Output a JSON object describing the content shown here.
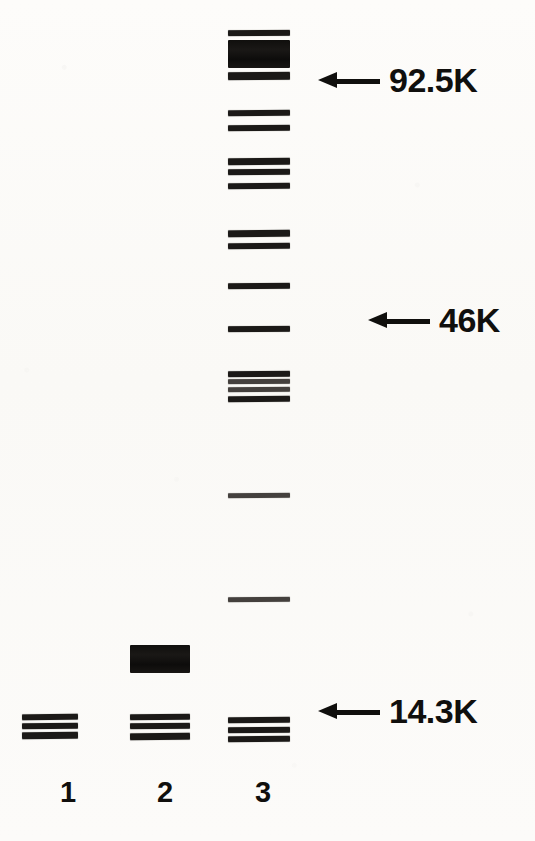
{
  "figure": {
    "type": "sds-page-gel-electrophoresis",
    "background_color": "#fbfaf7",
    "band_color": "#141210",
    "width": 535,
    "height": 841
  },
  "molecular_weight_markers": [
    {
      "label": "92.5K",
      "arrow": "left-arrow",
      "x": 318,
      "y": 63
    },
    {
      "label": "46K",
      "arrow": "left-arrow",
      "x": 368,
      "y": 303
    },
    {
      "label": "14.3K",
      "arrow": "left-arrow",
      "x": 318,
      "y": 694
    }
  ],
  "lane_labels": [
    {
      "label": "1",
      "x": 48,
      "y": 778
    },
    {
      "label": "2",
      "x": 145,
      "y": 778
    },
    {
      "label": "3",
      "x": 243,
      "y": 778
    }
  ],
  "lanes": [
    {
      "number": "1",
      "x": 22,
      "width": 56,
      "bands": [
        {
          "y": 714,
          "height": 6,
          "intensity": "strong",
          "skew": -0.7
        },
        {
          "y": 723,
          "height": 6,
          "intensity": "strong",
          "skew": -0.5
        },
        {
          "y": 732,
          "height": 7,
          "intensity": "strong",
          "skew": -0.6
        }
      ]
    },
    {
      "number": "2",
      "x": 130,
      "width": 60,
      "bands": [
        {
          "y": 645,
          "height": 28,
          "intensity": "very-strong",
          "skew": 0.0
        },
        {
          "y": 714,
          "height": 6,
          "intensity": "strong",
          "skew": -0.5
        },
        {
          "y": 723,
          "height": 6,
          "intensity": "strong",
          "skew": -0.4
        },
        {
          "y": 733,
          "height": 7,
          "intensity": "strong",
          "skew": -0.6
        }
      ]
    },
    {
      "number": "3",
      "x": 228,
      "width": 62,
      "bands": [
        {
          "y": 30,
          "height": 6,
          "intensity": "strong",
          "skew": -0.3
        },
        {
          "y": 40,
          "height": 28,
          "intensity": "very-strong",
          "skew": 0.0
        },
        {
          "y": 72,
          "height": 8,
          "intensity": "strong",
          "skew": -0.4
        },
        {
          "y": 110,
          "height": 6,
          "intensity": "strong",
          "skew": -0.5
        },
        {
          "y": 125,
          "height": 6,
          "intensity": "strong",
          "skew": -0.4
        },
        {
          "y": 158,
          "height": 7,
          "intensity": "strong",
          "skew": -0.5
        },
        {
          "y": 169,
          "height": 6,
          "intensity": "strong",
          "skew": -0.4
        },
        {
          "y": 183,
          "height": 6,
          "intensity": "strong",
          "skew": -0.5
        },
        {
          "y": 230,
          "height": 7,
          "intensity": "strong",
          "skew": -0.6
        },
        {
          "y": 243,
          "height": 6,
          "intensity": "strong",
          "skew": -0.5
        },
        {
          "y": 283,
          "height": 6,
          "intensity": "strong",
          "skew": -0.4
        },
        {
          "y": 326,
          "height": 6,
          "intensity": "strong",
          "skew": -0.3
        },
        {
          "y": 371,
          "height": 6,
          "intensity": "strong",
          "skew": -0.4
        },
        {
          "y": 379,
          "height": 5,
          "intensity": "medium",
          "skew": -0.3
        },
        {
          "y": 387,
          "height": 5,
          "intensity": "medium",
          "skew": -0.4
        },
        {
          "y": 396,
          "height": 6,
          "intensity": "strong",
          "skew": -0.5
        },
        {
          "y": 493,
          "height": 5,
          "intensity": "medium",
          "skew": -0.4
        },
        {
          "y": 597,
          "height": 5,
          "intensity": "medium",
          "skew": -0.4
        },
        {
          "y": 717,
          "height": 6,
          "intensity": "strong",
          "skew": -0.5
        },
        {
          "y": 727,
          "height": 6,
          "intensity": "strong",
          "skew": -0.4
        },
        {
          "y": 736,
          "height": 6,
          "intensity": "strong",
          "skew": -0.5
        }
      ]
    }
  ]
}
